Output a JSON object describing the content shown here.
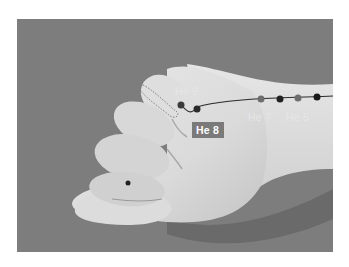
{
  "figure": {
    "meridian_line_color": "#2b2b2b",
    "points": [
      {
        "id": "he9",
        "label": "He 9",
        "boxed": false,
        "dot_color": "#3a3a3a"
      },
      {
        "id": "he8",
        "label": "He 8",
        "boxed": true,
        "dot_color": "#2a2a2a"
      },
      {
        "id": "he7",
        "label": "He 7",
        "boxed": false,
        "dot_color": "#6e6e6e"
      },
      {
        "id": "he6",
        "label": "",
        "boxed": false,
        "dot_color": "#222222"
      },
      {
        "id": "he5",
        "label": "He 5",
        "boxed": false,
        "dot_color": "#6e6e6e"
      },
      {
        "id": "he4",
        "label": "",
        "boxed": false,
        "dot_color": "#1a1a1a"
      }
    ],
    "colors": {
      "background_surface": "#7d7d7d",
      "skin_light": "#e2e2e2",
      "skin_shadow": "#b8b8b8",
      "label_box": "#7a7a7a",
      "label_text": "#ffffff"
    }
  }
}
